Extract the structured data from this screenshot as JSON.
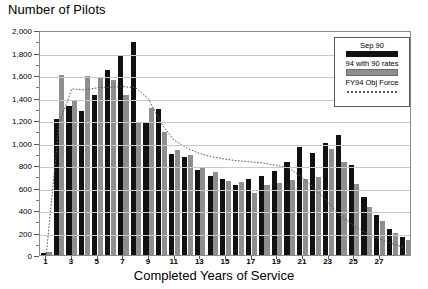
{
  "chart_data": {
    "type": "bar",
    "title": "Number of Pilots",
    "xlabel": "Completed Years of Service",
    "ylabel": "",
    "ylim": [
      0,
      2000
    ],
    "ytick_step": 200,
    "ytick_labels": [
      "2,000",
      "1,800",
      "1,600",
      "1,400",
      "1,200",
      "1,000",
      "800",
      "600",
      "400",
      "200",
      "0"
    ],
    "ytick_values": [
      2000,
      1800,
      1600,
      1400,
      1200,
      1000,
      800,
      600,
      400,
      200,
      0
    ],
    "xtick_labels": [
      "1",
      "3",
      "5",
      "7",
      "9",
      "11",
      "13",
      "15",
      "17",
      "19",
      "21",
      "23",
      "25",
      "27"
    ],
    "xtick_values": [
      1,
      3,
      5,
      7,
      9,
      11,
      13,
      15,
      17,
      19,
      21,
      23,
      25,
      27
    ],
    "grid": true,
    "legend_position": "top-right",
    "categories": [
      1,
      2,
      3,
      4,
      5,
      6,
      7,
      8,
      9,
      10,
      11,
      12,
      13,
      14,
      15,
      16,
      17,
      18,
      19,
      20,
      21,
      22,
      23,
      24,
      25,
      26,
      27,
      28,
      29
    ],
    "series": [
      {
        "name": "Sep 90",
        "color": "#111111",
        "style": "bar",
        "values": [
          20,
          1205,
          1325,
          1280,
          1420,
          1645,
          1780,
          1890,
          1185,
          1300,
          900,
          870,
          755,
          705,
          680,
          625,
          675,
          700,
          745,
          830,
          960,
          905,
          1000,
          1065,
          800,
          520,
          360,
          230,
          160
        ]
      },
      {
        "name": "94 with 90 rates",
        "color": "#8e8e8e",
        "style": "bar",
        "values": [
          25,
          1600,
          1370,
          1590,
          1570,
          1560,
          1420,
          1180,
          1305,
          1090,
          935,
          885,
          785,
          735,
          660,
          645,
          555,
          625,
          640,
          670,
          675,
          690,
          945,
          825,
          630,
          430,
          305,
          195,
          135
        ]
      },
      {
        "name": "FY94 Obj Force",
        "color": "#555555",
        "style": "dotted-line",
        "values": [
          15,
          1180,
          1490,
          1480,
          1500,
          1505,
          1510,
          1500,
          1400,
          1180,
          1030,
          960,
          910,
          880,
          860,
          845,
          835,
          825,
          805,
          780,
          700,
          600,
          480,
          360,
          270,
          200,
          150,
          105,
          70
        ]
      }
    ]
  },
  "legend": {
    "items": [
      {
        "label": "Sep 90",
        "swatch": "black"
      },
      {
        "label": "94 with 90 rates",
        "swatch": "gray"
      },
      {
        "label": "FY94 Obj Force",
        "swatch": "dots"
      }
    ]
  }
}
